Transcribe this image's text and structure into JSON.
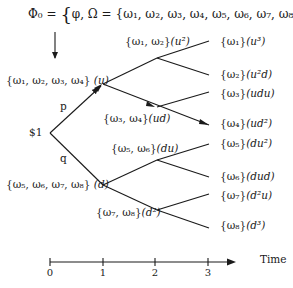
{
  "title": {
    "lhs": "Φ₀",
    "eq": "=",
    "open_brace": "{",
    "inner": "φ, Ω = {ω₁, ω₂, ω₃, ω₄, ω₅, ω₆, ω₇, ω₈}",
    "close_brace": "}"
  },
  "root": {
    "label": "$1"
  },
  "branch_probs": {
    "up": "p",
    "down": "q"
  },
  "nodes": {
    "t1_up": {
      "set": "{ω₁, ω₂, ω₃, ω₄}",
      "path": "(u)"
    },
    "t1_down": {
      "set": "{ω₅, ω₆, ω₇, ω₈}",
      "path": "(d)"
    },
    "t2_uu": {
      "set": "{ω₁, ω₂}",
      "path": "(u²)"
    },
    "t2_ud": {
      "set": "{ω₃, ω₄}",
      "path": "(ud)"
    },
    "t2_du": {
      "set": "{ω₅, ω₆}",
      "path": "(du)"
    },
    "t2_dd": {
      "set": "{ω₇, ω₈}",
      "path": "(d²)"
    }
  },
  "leaves": [
    {
      "set": "{ω₁}",
      "path": "(u³)"
    },
    {
      "set": "{ω₂}",
      "path": "(u²d)"
    },
    {
      "set": "{ω₃}",
      "path": "(udu)"
    },
    {
      "set": "{ω₄}",
      "path": "(ud²)"
    },
    {
      "set": "{ω₅}",
      "path": "(du²)"
    },
    {
      "set": "{ω₆}",
      "path": "(dud)"
    },
    {
      "set": "{ω₇}",
      "path": "(d²u)"
    },
    {
      "set": "{ω₈}",
      "path": "(d³)"
    }
  ],
  "time_axis": {
    "label": "Time",
    "ticks": [
      "0",
      "1",
      "2",
      "3"
    ]
  }
}
